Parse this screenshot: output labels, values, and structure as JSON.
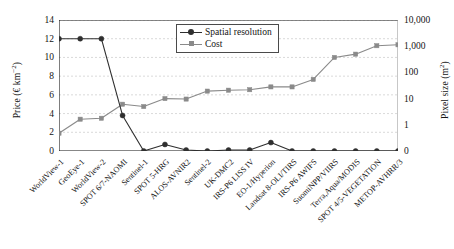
{
  "chart_data": {
    "type": "line",
    "title": "",
    "xlabel": "",
    "ylabel": "Price (€ km⁻²)",
    "y2label": "Pixel size (m²)",
    "ylim": [
      0,
      14
    ],
    "yticks": [
      "0",
      "2",
      "4",
      "6",
      "8",
      "10",
      "12",
      "14"
    ],
    "y2ticks": [
      "0",
      "1",
      "10",
      "100",
      "1,000",
      "10,000"
    ],
    "y2scale": "log",
    "grid": true,
    "legend_position": "top-center",
    "categories": [
      "WorldView-1",
      "GeoEye-1",
      "WorldView-2",
      "SPOT 6/7-NAOMI",
      "Sentinel-1",
      "SPOT 5-HRG",
      "ALOS-AVNIR2",
      "Sentinel-2",
      "UK-DMC2",
      "IRS-P6 LISS IV",
      "EO-1/Hyperion",
      "Landsat 8-OLI/TIRS",
      "IRS-P6 AWIFS",
      "SuomiNPP/VIIRS",
      "Terra,Aqua/MODIS",
      "SPOT 4/5-VEGETATION",
      "METOP-AVHRR/3"
    ],
    "series": [
      {
        "name": "Spatial resolution",
        "axis": "left",
        "color": "#2f2f2f",
        "marker": "circle",
        "values": [
          12.0,
          12.0,
          12.0,
          3.8,
          0.0,
          0.7,
          0.1,
          0.0,
          0.1,
          0.1,
          0.9,
          0.0,
          0.0,
          0.0,
          0.0,
          0.0,
          0.0
        ]
      },
      {
        "name": "Cost",
        "axis": "left",
        "color": "#8a8a8a",
        "marker": "square",
        "values": [
          1.9,
          3.4,
          3.5,
          5.0,
          4.75,
          5.6,
          5.55,
          6.4,
          6.5,
          6.55,
          6.85,
          6.85,
          7.65,
          10.0,
          10.35,
          11.25,
          11.35
        ]
      }
    ]
  },
  "legend": {
    "items": [
      {
        "label": "Spatial resolution"
      },
      {
        "label": "Cost"
      }
    ]
  },
  "axes": {
    "left_title_main": "Price (€ km",
    "left_title_sup": "−2",
    "left_title_tail": ")",
    "right_title_main": "Pixel size (m",
    "right_title_sup": "2",
    "right_title_tail": ")"
  }
}
